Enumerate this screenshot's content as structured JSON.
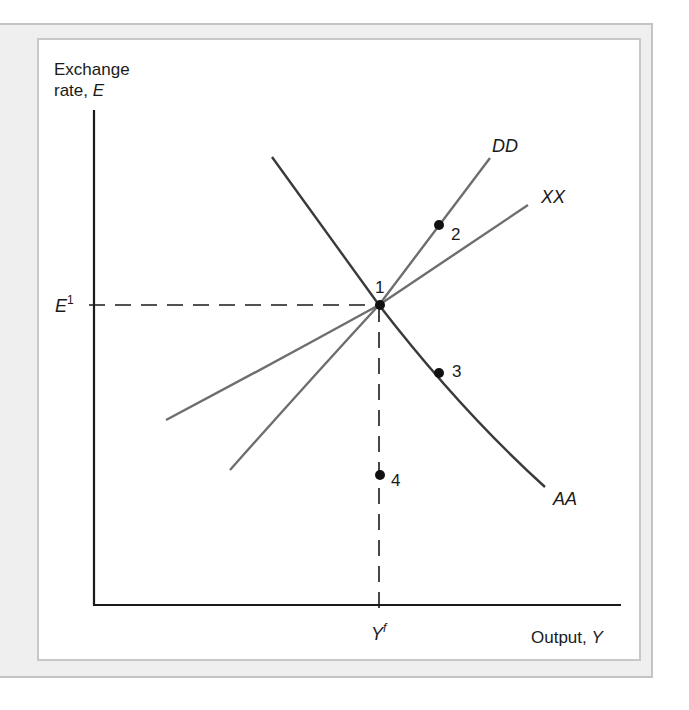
{
  "figure": {
    "y_axis_label_line1": "Exchange",
    "y_axis_label_line2_prefix": "rate, ",
    "y_axis_label_var": "E",
    "x_axis_label_prefix": "Output, ",
    "x_axis_label_var": "Y",
    "y_tick": {
      "base": "E",
      "sup": "1"
    },
    "x_tick": {
      "base": "Y",
      "sup": "f"
    },
    "curves": [
      {
        "name": "DD",
        "label": "DD",
        "color": "#6e6e6e"
      },
      {
        "name": "XX",
        "label": "XX",
        "color": "#6e6e6e"
      },
      {
        "name": "AA",
        "label": "AA",
        "color": "#3a3a3a"
      }
    ],
    "points": [
      {
        "id": "1",
        "label": "1",
        "description": "intersection of DD, XX, AA at (Yf, E1)"
      },
      {
        "id": "2",
        "label": "2",
        "description": "on DD above XX"
      },
      {
        "id": "3",
        "label": "3",
        "description": "on AA below point 1"
      },
      {
        "id": "4",
        "label": "4",
        "description": "below point 1 on Yf line"
      }
    ],
    "colors": {
      "frame_bg": "#efefef",
      "frame_border": "#c4c4c4",
      "axis": "#1a1a1a",
      "curve_gray": "#6e6e6e",
      "curve_dark": "#3a3a3a",
      "point": "#111111"
    }
  }
}
